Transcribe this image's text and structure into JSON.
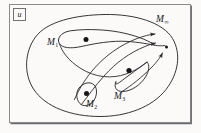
{
  "figure": {
    "caption_box_label": "u",
    "labels": {
      "m1": {
        "base": "M",
        "sub": "1"
      },
      "m2": {
        "base": "M",
        "sub": "2"
      },
      "m3": {
        "base": "M",
        "sub": "3"
      },
      "m_infinity": {
        "base": "M",
        "sub": "∞"
      }
    },
    "colors": {
      "background": "#fbfaf8",
      "ink": "#15161a",
      "stroke": "#2a2b2f",
      "frame": "#8a8b8f",
      "frame_shadow": "#6b6c70"
    },
    "elements": {
      "outer_region": "outer-oval",
      "subsets": [
        "m1-teardrop",
        "m2-teardrop",
        "m3-teardrop"
      ],
      "points": [
        "m1-point",
        "m2-point",
        "m3-point",
        "limit-point"
      ],
      "arrows": [
        "arrow-from-m1",
        "arrow-from-m2",
        "arrow-from-m2-outer",
        "arrow-from-m3"
      ]
    }
  }
}
